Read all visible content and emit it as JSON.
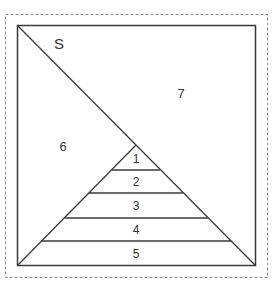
{
  "diagram": {
    "labels": {
      "S": "S",
      "region_6": "6",
      "region_7": "7",
      "band_1": "1",
      "band_2": "2",
      "band_3": "3",
      "band_4": "4",
      "band_5": "5"
    },
    "colors": {
      "line": "#3a3a3a",
      "dashed_border": "#8a8a8a",
      "text": "#333333"
    }
  }
}
